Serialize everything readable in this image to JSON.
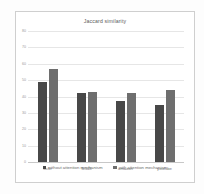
{
  "chart_data": {
    "type": "bar",
    "title": "Jaccard similarity",
    "xlabel": "",
    "ylabel": "",
    "ylim": [
      0,
      80
    ],
    "yticks": [
      "0",
      "10",
      "20",
      "30",
      "40",
      "50",
      "60",
      "70",
      "80"
    ],
    "grid": true,
    "legend_position": "bottom",
    "categories": [
      "flickr",
      "fk348",
      "amazon",
      "youtube"
    ],
    "series": [
      {
        "name": "without attention mechanism",
        "color": "#484848",
        "values": [
          49,
          42,
          37,
          35
        ]
      },
      {
        "name": "with attention mechanism",
        "color": "#6e6e6e",
        "values": [
          57,
          43,
          42,
          44
        ]
      }
    ]
  }
}
